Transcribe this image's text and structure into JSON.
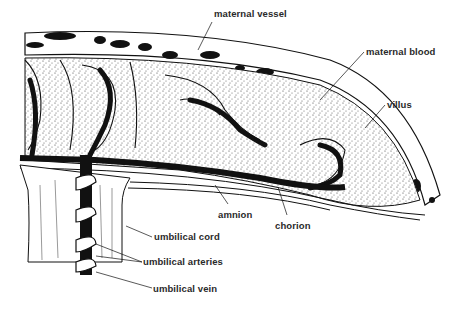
{
  "diagram": {
    "labels": [
      {
        "id": "maternal-vessel",
        "text": "maternal vessel",
        "x": 214,
        "y": 13
      },
      {
        "id": "maternal-blood",
        "text": "maternal blood",
        "x": 366,
        "y": 42
      },
      {
        "id": "villus",
        "text": "villus",
        "x": 387,
        "y": 97
      },
      {
        "id": "amnion",
        "text": "amnion",
        "x": 219,
        "y": 208
      },
      {
        "id": "chorion",
        "text": "chorion",
        "x": 275,
        "y": 220
      },
      {
        "id": "umbilical-cord",
        "text": "umbilical cord",
        "x": 154,
        "y": 234
      },
      {
        "id": "umbilical-arteries",
        "text": "umbilical arteries",
        "x": 144,
        "y": 257
      },
      {
        "id": "umbilical-vein",
        "text": "umbilical vein",
        "x": 154,
        "y": 283
      }
    ],
    "colors": {
      "ink": "#111111",
      "background": "#ffffff",
      "label": "#2a2a2a"
    }
  }
}
